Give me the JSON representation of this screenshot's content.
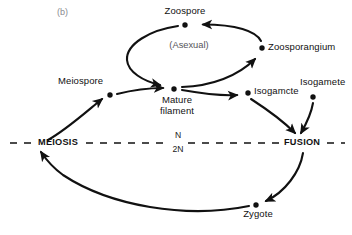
{
  "panel": {
    "label": "(b)"
  },
  "colors": {
    "stroke": "#111111",
    "node": "#111111",
    "background": "#ffffff",
    "asexual_text": "#55545a",
    "panel_text": "#8a8a90"
  },
  "phase_divider": {
    "style": "dashed",
    "left_label": "MEIOSIS",
    "right_label": "FUSION",
    "ploidy_above": "N",
    "ploidy_below": "2N"
  },
  "annotations": {
    "asexual": "(Asexual)"
  },
  "nodes": [
    {
      "id": "zoospore",
      "label": "Zoospore",
      "x": 185,
      "y": 25,
      "label_pos": "above"
    },
    {
      "id": "zoosporangium",
      "label": "Zoosporangium",
      "x": 262,
      "y": 48,
      "label_pos": "right"
    },
    {
      "id": "meiospore",
      "label": "Meiospore",
      "x": 110,
      "y": 95,
      "label_pos": "above-left"
    },
    {
      "id": "mature_filament",
      "label": "Mature filament",
      "x": 174,
      "y": 89,
      "label_pos": "below"
    },
    {
      "id": "isogamcte",
      "label": "Isogamcte",
      "x": 248,
      "y": 93,
      "label_pos": "right"
    },
    {
      "id": "isogamete",
      "label": "Isogamete",
      "x": 313,
      "y": 97,
      "label_pos": "above"
    },
    {
      "id": "zygote",
      "label": "Zygote",
      "x": 256,
      "y": 205,
      "label_pos": "below"
    }
  ],
  "edges": [
    {
      "id": "meiosis-to-meiospore",
      "from": "MEIOSIS",
      "to": "meiospore"
    },
    {
      "id": "meiospore-to-mature-filament",
      "from": "meiospore",
      "to": "mature_filament"
    },
    {
      "id": "mature-filament-to-zoosporangium",
      "from": "mature_filament",
      "to": "zoosporangium"
    },
    {
      "id": "zoosporangium-to-zoospore",
      "from": "zoosporangium",
      "to": "zoospore"
    },
    {
      "id": "zoospore-to-mature-filament",
      "from": "zoospore",
      "to": "mature_filament"
    },
    {
      "id": "mature-filament-to-isogamcte",
      "from": "mature_filament",
      "to": "isogamcte"
    },
    {
      "id": "isogamcte-to-fusion",
      "from": "isogamcte",
      "to": "FUSION"
    },
    {
      "id": "isogamete-to-fusion",
      "from": "isogamete",
      "to": "FUSION"
    },
    {
      "id": "fusion-to-zygote",
      "from": "FUSION",
      "to": "zygote"
    },
    {
      "id": "zygote-to-meiosis",
      "from": "zygote",
      "to": "MEIOSIS"
    }
  ]
}
